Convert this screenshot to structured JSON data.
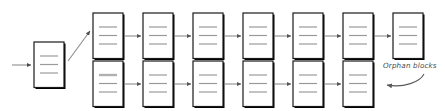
{
  "diagram": {
    "colors": {
      "block_border": "#1a1a1a",
      "block_fill": "#ffffff",
      "block_shadow": "#000000",
      "block_line": "#9a9a9a",
      "block_line_strong": "#b0b0b0",
      "arrow": "#8c8c8c",
      "diagonal": "#8c8c8c",
      "annotation_text": "#4a4a4a",
      "annotation_arrow": "#5a5a5a",
      "background": "#ffffff"
    },
    "block_geometry": {
      "width": 30,
      "height": 47,
      "spacing": 50,
      "line_count": 3,
      "border_width": 1,
      "shadow_width": 2
    },
    "genesis": {
      "name": "genesis-block",
      "x": 34,
      "y": 42,
      "line_count": 3,
      "incoming_arrow": {
        "from_x": 12,
        "to_x": 33,
        "y": 65
      }
    },
    "main_chain": {
      "name": "main-chain",
      "label": "main chain",
      "row_y": 13,
      "start_x": 93,
      "block_count": 7,
      "blocks": [
        {
          "index": 1,
          "x": 93,
          "lines": 3,
          "first_line_strong": false
        },
        {
          "index": 2,
          "x": 143,
          "lines": 3,
          "first_line_strong": false
        },
        {
          "index": 3,
          "x": 193,
          "lines": 3,
          "first_line_strong": false
        },
        {
          "index": 4,
          "x": 243,
          "lines": 3,
          "first_line_strong": false
        },
        {
          "index": 5,
          "x": 293,
          "lines": 3,
          "first_line_strong": false
        },
        {
          "index": 6,
          "x": 343,
          "lines": 3,
          "first_line_strong": false
        },
        {
          "index": 7,
          "x": 393,
          "lines": 3,
          "first_line_strong": false
        }
      ]
    },
    "orphan_chain": {
      "name": "orphan-chain",
      "label": "orphan chain",
      "row_y": 61,
      "start_x": 93,
      "block_count": 6,
      "blocks": [
        {
          "index": 1,
          "x": 93,
          "lines": 3,
          "first_line_strong": true
        },
        {
          "index": 2,
          "x": 143,
          "lines": 3,
          "first_line_strong": false
        },
        {
          "index": 3,
          "x": 193,
          "lines": 3,
          "first_line_strong": false
        },
        {
          "index": 4,
          "x": 243,
          "lines": 3,
          "first_line_strong": false
        },
        {
          "index": 5,
          "x": 293,
          "lines": 3,
          "first_line_strong": false
        },
        {
          "index": 6,
          "x": 343,
          "lines": 3,
          "first_line_strong": false
        }
      ]
    },
    "fork_connector": {
      "name": "fork-connector",
      "from_x": 68,
      "from_y": 60,
      "to_x": 92,
      "to_y": 30
    },
    "annotation": {
      "name": "orphan-blocks-annotation",
      "text": "Orphan blocks",
      "text_x": 383,
      "text_y": 65,
      "arrow_start_x": 424,
      "arrow_start_y": 74,
      "arrow_end_x": 386,
      "arrow_end_y": 85
    }
  }
}
